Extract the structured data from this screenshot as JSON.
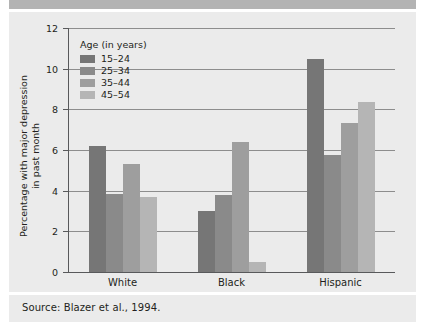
{
  "caption": "Source: Blazer et al., 1994.",
  "legend": {
    "title": "Age (in years)",
    "entries": [
      {
        "label": "15–24",
        "color": "#767676"
      },
      {
        "label": "25–34",
        "color": "#8a8a8a"
      },
      {
        "label": "35–44",
        "color": "#9e9e9e"
      },
      {
        "label": "45–54",
        "color": "#b5b5b5"
      }
    ]
  },
  "chart_data": {
    "type": "bar",
    "title": "",
    "xlabel": "",
    "ylabel": "Percentage with major depression\nin past month",
    "ylim": [
      0,
      12
    ],
    "yticks": [
      0,
      2,
      4,
      6,
      8,
      10,
      12
    ],
    "ytick_labels": [
      "0",
      "2",
      "4",
      "6",
      "8",
      "10",
      "12"
    ],
    "grid": true,
    "legend_position": "upper-left-inside",
    "categories": [
      "White",
      "Black",
      "Hispanic"
    ],
    "series": [
      {
        "name": "15–24",
        "color": "#767676",
        "values": [
          6.2,
          3.0,
          10.5
        ]
      },
      {
        "name": "25–34",
        "color": "#8a8a8a",
        "values": [
          3.85,
          3.8,
          5.75
        ]
      },
      {
        "name": "35–44",
        "color": "#9e9e9e",
        "values": [
          5.3,
          6.4,
          7.35
        ]
      },
      {
        "name": "45–54",
        "color": "#b5b5b5",
        "values": [
          3.7,
          0.5,
          8.35
        ]
      }
    ]
  }
}
